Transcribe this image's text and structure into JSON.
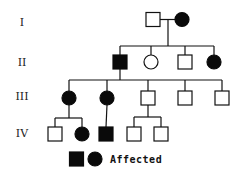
{
  "diagram": {
    "type": "pedigree-chart",
    "generations": [
      {
        "label": "I",
        "y": 26
      },
      {
        "label": "II",
        "y": 66
      },
      {
        "label": "III",
        "y": 100
      },
      {
        "label": "IV",
        "y": 137
      }
    ],
    "individuals": [
      {
        "id": "I-1",
        "sex": "male",
        "affected": false,
        "x": 153,
        "y": 19.5
      },
      {
        "id": "I-2",
        "sex": "female",
        "affected": true,
        "x": 182,
        "y": 19.5
      },
      {
        "id": "II-1",
        "sex": "male",
        "affected": true,
        "x": 120,
        "y": 62
      },
      {
        "id": "II-2",
        "sex": "female",
        "affected": false,
        "x": 151,
        "y": 62
      },
      {
        "id": "II-3",
        "sex": "male",
        "affected": false,
        "x": 185,
        "y": 62
      },
      {
        "id": "II-4",
        "sex": "female",
        "affected": true,
        "x": 214,
        "y": 62
      },
      {
        "id": "III-1",
        "sex": "female",
        "affected": true,
        "x": 69,
        "y": 98
      },
      {
        "id": "III-2",
        "sex": "female",
        "affected": true,
        "x": 107,
        "y": 98
      },
      {
        "id": "III-3",
        "sex": "male",
        "affected": false,
        "x": 148,
        "y": 98
      },
      {
        "id": "III-4",
        "sex": "male",
        "affected": false,
        "x": 185,
        "y": 98
      },
      {
        "id": "III-5",
        "sex": "male",
        "affected": false,
        "x": 222,
        "y": 98
      },
      {
        "id": "IV-1",
        "sex": "male",
        "affected": false,
        "x": 55,
        "y": 134
      },
      {
        "id": "IV-2",
        "sex": "female",
        "affected": true,
        "x": 82,
        "y": 134
      },
      {
        "id": "IV-3",
        "sex": "male",
        "affected": true,
        "x": 106,
        "y": 134
      },
      {
        "id": "IV-4",
        "sex": "male",
        "affected": false,
        "x": 134,
        "y": 134
      },
      {
        "id": "IV-5",
        "sex": "male",
        "affected": false,
        "x": 161,
        "y": 134
      }
    ],
    "lines": [
      {
        "x1": 160,
        "y1": 19.5,
        "x2": 175,
        "y2": 19.5
      },
      {
        "x1": 168,
        "y1": 19.5,
        "x2": 168,
        "y2": 46
      },
      {
        "x1": 120,
        "y1": 46,
        "x2": 214,
        "y2": 46
      },
      {
        "x1": 120,
        "y1": 46,
        "x2": 120,
        "y2": 55
      },
      {
        "x1": 151,
        "y1": 46,
        "x2": 151,
        "y2": 55
      },
      {
        "x1": 185,
        "y1": 46,
        "x2": 185,
        "y2": 55
      },
      {
        "x1": 214,
        "y1": 46,
        "x2": 214,
        "y2": 55
      },
      {
        "x1": 120,
        "y1": 69,
        "x2": 120,
        "y2": 80
      },
      {
        "x1": 69,
        "y1": 80,
        "x2": 222,
        "y2": 80
      },
      {
        "x1": 69,
        "y1": 80,
        "x2": 69,
        "y2": 91
      },
      {
        "x1": 107,
        "y1": 80,
        "x2": 107,
        "y2": 91
      },
      {
        "x1": 148,
        "y1": 80,
        "x2": 148,
        "y2": 91
      },
      {
        "x1": 185,
        "y1": 80,
        "x2": 185,
        "y2": 91
      },
      {
        "x1": 222,
        "y1": 80,
        "x2": 222,
        "y2": 91
      },
      {
        "x1": 69,
        "y1": 105,
        "x2": 69,
        "y2": 118
      },
      {
        "x1": 55,
        "y1": 118,
        "x2": 82,
        "y2": 118
      },
      {
        "x1": 55,
        "y1": 118,
        "x2": 55,
        "y2": 127
      },
      {
        "x1": 82,
        "y1": 118,
        "x2": 82,
        "y2": 127
      },
      {
        "x1": 107,
        "y1": 105,
        "x2": 106,
        "y2": 127
      },
      {
        "x1": 148,
        "y1": 105,
        "x2": 148,
        "y2": 117
      },
      {
        "x1": 134,
        "y1": 117,
        "x2": 161,
        "y2": 117
      },
      {
        "x1": 134,
        "y1": 117,
        "x2": 134,
        "y2": 127
      },
      {
        "x1": 161,
        "y1": 117,
        "x2": 161,
        "y2": 127
      }
    ],
    "symbol_size": 14
  },
  "legend": {
    "label": "Affected",
    "symbols": [
      {
        "sex": "male",
        "affected": true,
        "x": 76.5,
        "y": 159
      },
      {
        "sex": "female",
        "affected": true,
        "x": 95,
        "y": 159
      }
    ],
    "text_x": 110,
    "text_y": 163
  },
  "colors": {
    "affected_fill": "#0a0a0a",
    "unaffected_fill": "#ffffff",
    "stroke": "#111111"
  }
}
